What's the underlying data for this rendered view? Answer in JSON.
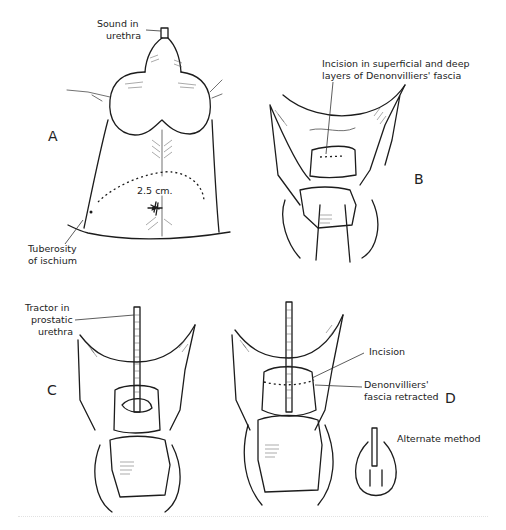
{
  "figure": {
    "panels": [
      {
        "id": "A",
        "letter": "A",
        "labels": {
          "sound": "Sound in\nurethra",
          "sound_line1": "Sound in",
          "sound_line2": "urethra",
          "measurement": "2.5 cm.",
          "tuberosity_line1": "Tuberosity",
          "tuberosity_line2": "of ischium"
        }
      },
      {
        "id": "B",
        "letter": "B",
        "labels": {
          "incision_line1": "Incision in superficial and deep",
          "incision_line2": "layers of Denonvilliers' fascia"
        }
      },
      {
        "id": "C",
        "letter": "C",
        "labels": {
          "tractor_line1": "Tractor in",
          "tractor_line2": "prostatic",
          "tractor_line3": "urethra"
        }
      },
      {
        "id": "D",
        "letter": "D",
        "labels": {
          "incision": "Incision",
          "fascia_line1": "Denonvilliers'",
          "fascia_line2": "fascia retracted",
          "alternate": "Alternate method"
        }
      }
    ],
    "colors": {
      "ink": "#1c1c1c",
      "background": "#ffffff"
    }
  }
}
